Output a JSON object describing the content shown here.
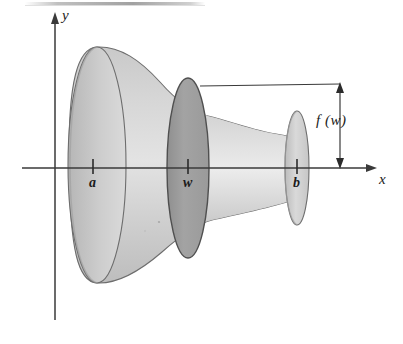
{
  "figure": {
    "kind": "solid-of-revolution-diagram",
    "background_color": "#ffffff",
    "ink_color": "#1b1b1b",
    "axes": {
      "x_label": "x",
      "y_label": "y",
      "x_axis": {
        "y": 168,
        "x_start": 22,
        "x_end": 377,
        "arrow": "right"
      },
      "y_axis": {
        "x": 55,
        "y_start": 13,
        "y_end": 320,
        "arrow": "up"
      }
    },
    "tick_labels": [
      {
        "name": "a",
        "text": "a",
        "x": 93,
        "axis_y": 168
      },
      {
        "name": "w",
        "text": "w",
        "x": 188,
        "axis_y": 168
      },
      {
        "name": "b",
        "text": "b",
        "x": 297,
        "axis_y": 168
      }
    ],
    "annotation": {
      "label": "f (w)",
      "leader_line": {
        "x_start": 200,
        "x_end": 340,
        "y": 84
      },
      "dimension_line": {
        "x": 340,
        "y_top": 84,
        "y_bottom": 168,
        "arrows": "both"
      }
    },
    "solid": {
      "surface_fill_light": "#d8d8d8",
      "surface_fill_mid": "#c4c4c4",
      "disk_fill": "#9d9d9d",
      "cap_fill": "#cfcfcf",
      "outline_color": "#5a5a5a"
    },
    "scan_artifact": {
      "description": "faint gray smudge along top edge",
      "x_start": 25,
      "x_end": 205,
      "y": 4,
      "color": "#a9a9a9"
    }
  }
}
